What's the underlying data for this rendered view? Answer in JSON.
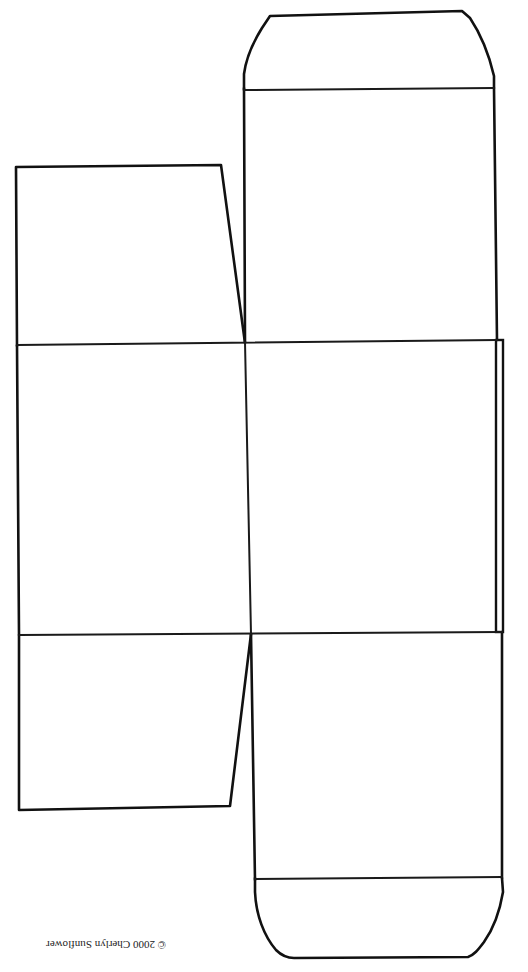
{
  "diagram": {
    "stroke_color": "#111111",
    "background": "#ffffff",
    "panels": [
      {
        "id": "top-tuck-tab",
        "points": "244,88 247,60 262,30 270,16 462,11 470,18 484,42 494,76 494,88"
      },
      {
        "id": "top-panel",
        "x1": 244,
        "y1": 88,
        "x2": 494,
        "y2": 340
      },
      {
        "id": "left-top-dust-flap",
        "points": "16,167 221,165 245,343 17,346"
      },
      {
        "id": "center-panel-left",
        "x1": 17,
        "y1": 343,
        "x2": 251,
        "y2": 634
      },
      {
        "id": "center-panel-right",
        "x1": 245,
        "y1": 340,
        "x2": 500,
        "y2": 632
      },
      {
        "id": "glue-strip",
        "x1": 496,
        "y1": 340,
        "x2": 503,
        "y2": 632
      },
      {
        "id": "left-bottom-dust-flap",
        "points": "19,634 251,634 230,806 19,810"
      },
      {
        "id": "bottom-panel",
        "x1": 251,
        "y1": 632,
        "x2": 502,
        "y2": 878
      },
      {
        "id": "bottom-tuck-tab",
        "points": "255,878 254,895 258,918 268,940 282,955 292,958 468,957 476,952 488,936 499,912 503,893 502,878"
      }
    ],
    "fold_lines": [
      {
        "id": "fold-top-tab",
        "x1": 244,
        "y1": 90,
        "x2": 494,
        "y2": 88
      },
      {
        "id": "fold-upper",
        "x1": 17,
        "y1": 345,
        "x2": 497,
        "y2": 340
      },
      {
        "id": "fold-lower",
        "x1": 19,
        "y1": 635,
        "x2": 502,
        "y2": 632
      },
      {
        "id": "fold-center-vertical",
        "x1": 245,
        "y1": 342,
        "x2": 251,
        "y2": 634
      },
      {
        "id": "fold-bottom-tab",
        "x1": 255,
        "y1": 879,
        "x2": 502,
        "y2": 877
      }
    ]
  },
  "footer": {
    "copyright": "© 2000 Cherlyn Sunflower",
    "orientation": "upside-down"
  }
}
